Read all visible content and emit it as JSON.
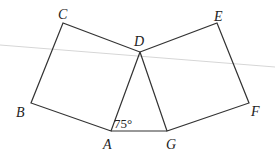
{
  "diagram": {
    "type": "geometry",
    "points": {
      "A": {
        "label": "A",
        "x": 111,
        "y": 131
      },
      "B": {
        "label": "B",
        "x": 31,
        "y": 103
      },
      "C": {
        "label": "C",
        "x": 63,
        "y": 23
      },
      "D": {
        "label": "D",
        "x": 140,
        "y": 52
      },
      "E": {
        "label": "E",
        "x": 217,
        "y": 23
      },
      "F": {
        "label": "F",
        "x": 249,
        "y": 103
      },
      "G": {
        "label": "G",
        "x": 167,
        "y": 131
      }
    },
    "angle_label": "75°",
    "colors": {
      "stroke": "#333333",
      "faint_line": "#d0d0d0"
    }
  }
}
